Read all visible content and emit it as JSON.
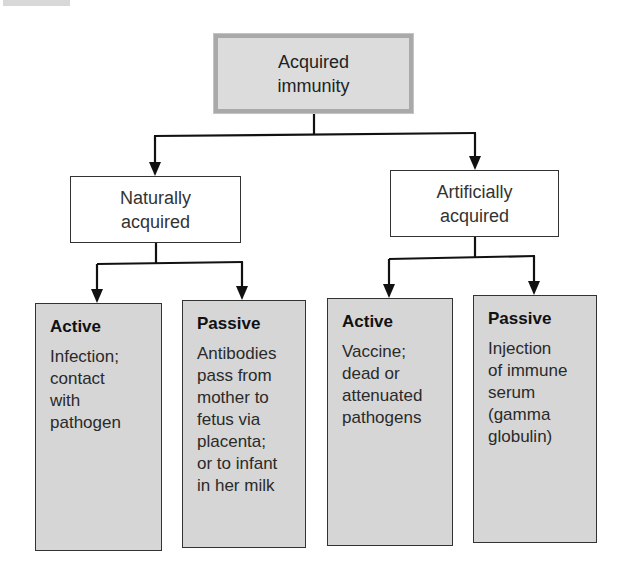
{
  "diagram": {
    "type": "hierarchy",
    "root": {
      "label_lines": [
        "Acquired",
        "immunity"
      ]
    },
    "branches": [
      {
        "label_lines": [
          "Naturally",
          "acquired"
        ],
        "children": [
          {
            "title": "Active",
            "lines": [
              "Infection;",
              "contact",
              "with",
              "pathogen"
            ]
          },
          {
            "title": "Passive",
            "lines": [
              "Antibodies",
              "pass from",
              "mother to",
              "fetus via",
              "placenta;",
              "or to infant",
              "in her milk"
            ]
          }
        ]
      },
      {
        "label_lines": [
          "Artificially",
          "acquired"
        ],
        "children": [
          {
            "title": "Active",
            "lines": [
              "Vaccine;",
              "dead or",
              "attenuated",
              "pathogens"
            ]
          },
          {
            "title": "Passive",
            "lines": [
              "Injection",
              "of immune",
              "serum",
              "(gamma",
              "globulin)"
            ]
          }
        ]
      }
    ]
  },
  "colors": {
    "root_fill": "#dcdcdc",
    "root_border": "#a9a9a9",
    "leaf_fill": "#d6d6d6",
    "line": "#111111"
  }
}
